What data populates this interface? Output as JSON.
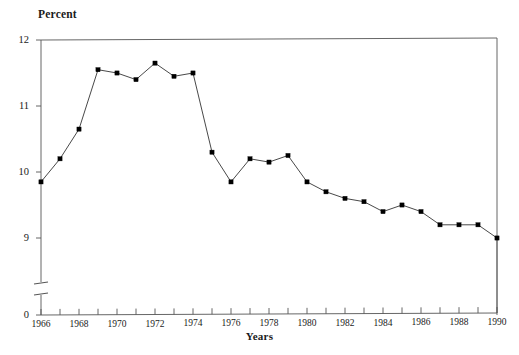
{
  "chart_data": {
    "type": "line",
    "title": "",
    "ylabel": "Percent",
    "xlabel": "Years",
    "grid": false,
    "legend": "none",
    "axis_break": {
      "present": true,
      "between": [
        0,
        9
      ],
      "style": "double-slash-horizontal-ticks"
    },
    "ylim": [
      9,
      12
    ],
    "y_ticks": [
      0,
      9,
      10,
      11,
      12
    ],
    "y_tick_labels": [
      "0",
      "9",
      "10",
      "11",
      "12"
    ],
    "xlim": [
      1966,
      1990
    ],
    "x_ticks": [
      1966,
      1967,
      1968,
      1969,
      1970,
      1971,
      1972,
      1973,
      1974,
      1975,
      1976,
      1977,
      1978,
      1979,
      1980,
      1981,
      1982,
      1983,
      1984,
      1985,
      1986,
      1987,
      1988,
      1989,
      1990
    ],
    "x_tick_labels_shown": [
      "1966",
      "1968",
      "1970",
      "1972",
      "1974",
      "1976",
      "1978",
      "1980",
      "1982",
      "1984",
      "1986",
      "1988",
      "1990"
    ],
    "x": [
      1966,
      1967,
      1968,
      1969,
      1970,
      1971,
      1972,
      1973,
      1974,
      1975,
      1976,
      1977,
      1978,
      1979,
      1980,
      1981,
      1982,
      1983,
      1984,
      1985,
      1986,
      1987,
      1988,
      1989,
      1990
    ],
    "values": [
      9.85,
      10.2,
      10.65,
      11.55,
      11.5,
      11.4,
      11.65,
      11.45,
      11.5,
      10.3,
      9.85,
      10.2,
      10.15,
      10.25,
      9.85,
      9.7,
      9.6,
      9.55,
      9.4,
      9.5,
      9.4,
      9.2,
      9.2,
      9.2,
      9.0
    ],
    "marker": "square",
    "marker_color": "#000000",
    "line_color": "#333333",
    "series": [
      {
        "name": "Percent",
        "values": [
          9.85,
          10.2,
          10.65,
          11.55,
          11.5,
          11.4,
          11.65,
          11.45,
          11.5,
          10.3,
          9.85,
          10.2,
          10.15,
          10.25,
          9.85,
          9.7,
          9.6,
          9.55,
          9.4,
          9.5,
          9.4,
          9.2,
          9.2,
          9.2,
          9.0
        ]
      }
    ]
  },
  "axes": {
    "y_axis_title": "Percent",
    "x_axis_title": "Years"
  },
  "colors": {
    "background": "#ffffff",
    "axis": "#555555",
    "line": "#333333",
    "marker": "#000000",
    "text": "#1a1a1a"
  }
}
